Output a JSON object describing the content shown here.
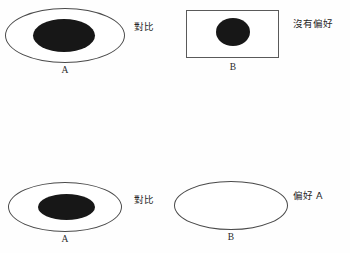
{
  "figure": {
    "title": "",
    "colors": {
      "blob_fill": "#171717",
      "outline": "#4a4a4a",
      "background": "#fefefe",
      "text": "#262626"
    },
    "rows": [
      {
        "id": "row-1",
        "left": {
          "letter": "A",
          "container_shape": "ellipse",
          "container_filled": false,
          "inner_blob": true,
          "inner_blob_shape": "ellipse"
        },
        "middle_label": "對比",
        "right": {
          "letter": "B",
          "container_shape": "rectangle",
          "container_filled": false,
          "inner_blob": true,
          "inner_blob_shape": "ellipse"
        },
        "judgment": "沒有偏好"
      },
      {
        "id": "row-2",
        "left": {
          "letter": "A",
          "container_shape": "ellipse",
          "container_filled": false,
          "inner_blob": true,
          "inner_blob_shape": "ellipse"
        },
        "middle_label": "對比",
        "right": {
          "letter": "B",
          "container_shape": "ellipse",
          "container_filled": false,
          "inner_blob": false,
          "inner_blob_shape": ""
        },
        "judgment": "偏好 A"
      },
      {
        "id": "row-3",
        "left": {
          "letter": "A",
          "container_shape": "rectangle",
          "container_filled": false,
          "inner_blob": true,
          "inner_blob_shape": "ellipse"
        },
        "middle_label": "對比",
        "right": {
          "letter": "B",
          "container_shape": "rectangle",
          "container_filled": false,
          "inner_blob": false,
          "inner_blob_shape": ""
        },
        "judgment": "偏好 A"
      }
    ]
  }
}
